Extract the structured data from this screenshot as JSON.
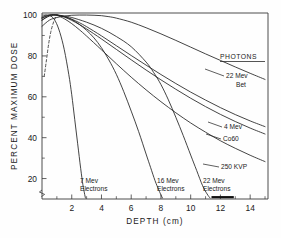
{
  "chart_data": {
    "type": "line",
    "title": "",
    "xlabel": "DEPTH  (cm)",
    "ylabel": "PERCENT MAXIMUM DOSE",
    "xlim": [
      0,
      15.2
    ],
    "ylim": [
      10,
      101
    ],
    "grid": false,
    "legend": "inline-right-annotations",
    "xticks": [
      2,
      4,
      6,
      8,
      10,
      12,
      14
    ],
    "xtick_labels": [
      "2",
      "4",
      "6",
      "8",
      "10",
      "12",
      "14"
    ],
    "xticks_minor": [
      1,
      3,
      5,
      7,
      9,
      11,
      13,
      15
    ],
    "yticks": [
      20,
      40,
      60,
      80,
      100
    ],
    "ytick_labels": [
      "20",
      "40",
      "60",
      "80",
      "100"
    ],
    "yticks_minor": [
      30,
      50,
      70,
      90
    ],
    "y_axis_break": true,
    "group_headings": [
      {
        "label": "PHOTONS",
        "underlined": true,
        "x": 12.6,
        "y": 82
      }
    ],
    "series": [
      {
        "name": "22 Mev Bet",
        "label": "22 Mev\nBet",
        "label_lines": [
          "22 Mev",
          "Bet"
        ],
        "style": "solid",
        "kind": "photon",
        "x": [
          0,
          0.5,
          1,
          1.5,
          2,
          2.5,
          3,
          3.5,
          4,
          4.5,
          5,
          6,
          7,
          8,
          9,
          10,
          11,
          12,
          13,
          14,
          15
        ],
        "y": [
          94.5,
          97.5,
          98.8,
          99.5,
          99.9,
          100,
          100,
          99.9,
          99.7,
          99.2,
          98.5,
          96.5,
          93.8,
          90.8,
          87.6,
          84.3,
          81.0,
          77.8,
          74.6,
          71.5,
          68.5
        ]
      },
      {
        "name": "4 Mev",
        "label": "4 Mev",
        "label_lines": [
          "4 Mev"
        ],
        "style": "solid",
        "kind": "photon",
        "x": [
          0,
          0.5,
          1,
          1.5,
          2,
          2.5,
          3,
          4,
          5,
          6,
          7,
          8,
          9,
          10,
          11,
          12,
          13,
          14,
          15
        ],
        "y": [
          98.5,
          100,
          100,
          99.3,
          98.0,
          96.3,
          94.3,
          89.8,
          85.0,
          80.2,
          75.5,
          70.9,
          66.5,
          62.3,
          58.4,
          54.7,
          51.3,
          48.2,
          45.4
        ]
      },
      {
        "name": "Co60",
        "label": "Co60",
        "label_lines": [
          "Co60"
        ],
        "style": "solid",
        "kind": "photon",
        "x": [
          0,
          0.5,
          1,
          1.5,
          2,
          2.5,
          3,
          4,
          5,
          6,
          7,
          8,
          9,
          10,
          11,
          12,
          13,
          14,
          15
        ],
        "y": [
          97.5,
          99.8,
          100,
          99.0,
          97.4,
          95.4,
          93.2,
          88.3,
          83.2,
          78.1,
          73.1,
          68.3,
          63.7,
          59.3,
          55.2,
          51.4,
          47.9,
          44.7,
          41.8
        ]
      },
      {
        "name": "250 KVP",
        "label": "250 KVP",
        "label_lines": [
          "250 KVP"
        ],
        "style": "solid-with-dashed-buildup",
        "kind": "photon",
        "buildup_dashed": {
          "x": [
            0.15,
            0.3,
            0.45,
            0.6,
            0.8,
            1.0
          ],
          "y": [
            70,
            78,
            86,
            92,
            97,
            100
          ]
        },
        "x": [
          1.0,
          1.5,
          2,
          2.5,
          3,
          4,
          5,
          6,
          7,
          8,
          9,
          10,
          11,
          12,
          13,
          14,
          15
        ],
        "y": [
          100,
          98.2,
          95.8,
          92.9,
          89.7,
          83.0,
          76.2,
          69.6,
          63.4,
          57.6,
          52.2,
          47.2,
          42.7,
          38.5,
          34.8,
          31.4,
          28.3
        ]
      },
      {
        "name": "7 Mev Electrons",
        "label": "7 Mev\nElectrons",
        "label_lines": [
          "7 Mev",
          "Electrons"
        ],
        "style": "solid",
        "kind": "electron",
        "x": [
          0,
          0.3,
          0.6,
          0.9,
          1.2,
          1.5,
          1.8,
          2.0,
          2.2,
          2.4,
          2.6,
          2.75,
          2.85,
          2.92
        ],
        "y": [
          99.0,
          100,
          99.5,
          97.0,
          91.5,
          83.0,
          71.0,
          61.0,
          49.0,
          37.0,
          25.0,
          17.0,
          13.0,
          10.5
        ]
      },
      {
        "name": "16 Mev Electrons",
        "label": "16 Mev\nElectrons",
        "label_lines": [
          "16 Mev",
          "Electrons"
        ],
        "style": "solid",
        "kind": "electron",
        "x": [
          0,
          0.5,
          1,
          1.5,
          2,
          2.5,
          3,
          3.5,
          4,
          4.5,
          5,
          5.5,
          6,
          6.5,
          7,
          7.3,
          7.6,
          7.85,
          8.0,
          8.1
        ],
        "y": [
          98.5,
          100,
          100,
          99.2,
          97.8,
          95.5,
          92.5,
          88.8,
          84.0,
          78.0,
          71.0,
          62.5,
          53.0,
          43.0,
          32.0,
          25.5,
          19.0,
          14.5,
          12.0,
          10.5
        ]
      },
      {
        "name": "22 Mev Electrons",
        "label": "22 Mev\nElectrons",
        "label_lines": [
          "22 Mev",
          "Electrons"
        ],
        "style": "solid",
        "kind": "electron",
        "x": [
          0,
          0.5,
          1,
          1.5,
          2,
          3,
          4,
          5,
          6,
          7,
          7.5,
          8,
          8.5,
          9,
          9.5,
          10,
          10.4,
          10.8,
          11.1,
          11.3
        ],
        "y": [
          97.5,
          99.5,
          100,
          99.5,
          98.8,
          96.5,
          93.5,
          89.5,
          84.5,
          77.0,
          72.0,
          66.0,
          58.5,
          50.0,
          41.0,
          31.5,
          24.0,
          16.5,
          12.5,
          10.5
        ]
      }
    ],
    "annotations": [
      {
        "text": "PHOTONS",
        "x": 12.6,
        "y": 82
      },
      {
        "text": "22 Mev",
        "x": 12.6,
        "y": 72.5
      },
      {
        "text": "Bet",
        "x": 13.1,
        "y": 67.5
      },
      {
        "text": "4 Mev",
        "x": 12.7,
        "y": 47.5
      },
      {
        "text": "Co60",
        "x": 12.7,
        "y": 41.5
      },
      {
        "text": "250 KVP",
        "x": 12.4,
        "y": 26.5
      },
      {
        "text": "7 Mev",
        "x": 3.2,
        "y": 18.5
      },
      {
        "text": "Electrons",
        "x": 3.2,
        "y": 14.5
      },
      {
        "text": "16 Mev",
        "x": 8.3,
        "y": 18.5
      },
      {
        "text": "Electrons",
        "x": 8.3,
        "y": 14.5
      },
      {
        "text": "22 Mev",
        "x": 11.4,
        "y": 18.5
      },
      {
        "text": "Electrons",
        "x": 11.4,
        "y": 14.5
      }
    ],
    "marker_bar": {
      "x_start": 11.4,
      "x_end": 12.9,
      "y": 10.9
    }
  },
  "axes": {
    "y_title": "PERCENT MAXIMUM DOSE",
    "x_title": "DEPTH  (cm)"
  },
  "labels": {
    "photons_heading": "PHOTONS",
    "bet_line1": "22 Mev",
    "bet_line2": "Bet",
    "mev4": "4 Mev",
    "co60": "Co60",
    "kvp250": "250 KVP",
    "e7_line1": "7 Mev",
    "e7_line2": "Electrons",
    "e16_line1": "16 Mev",
    "e16_line2": "Electrons",
    "e22_line1": "22 Mev",
    "e22_line2": "Electrons"
  },
  "ticks": {
    "y": [
      "100",
      "80",
      "60",
      "40",
      "20"
    ],
    "x": [
      "2",
      "4",
      "6",
      "8",
      "10",
      "12",
      "14"
    ]
  }
}
